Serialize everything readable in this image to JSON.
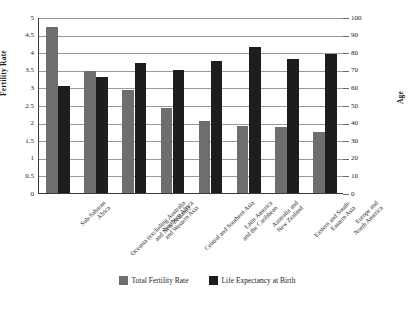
{
  "chart_data": {
    "type": "bar",
    "title": "",
    "xlabel": "",
    "ylabel": "Fertility Rate",
    "y2label": "Age",
    "ylim": [
      0,
      5
    ],
    "y2lim": [
      0,
      100
    ],
    "yticks": [
      "0",
      "0.5",
      "1",
      "1.5",
      "2",
      "2.5",
      "3",
      "3.5",
      "4",
      "4.5",
      "5"
    ],
    "y2ticks": [
      "0",
      "10",
      "20",
      "30",
      "40",
      "50",
      "60",
      "70",
      "80",
      "90",
      "100"
    ],
    "grid": true,
    "legend_position": "bottom",
    "categories": [
      "Sub-Saharan\nAfrica",
      "Oceania (excluding Australia\nand New Zealand)",
      "Northern Africa\nand Western Asia",
      "Central and Southern Asia",
      "Latin America\nand the Caribbean",
      "Australia and\nNew Zealand",
      "Eastern and South-\nEastern Asia",
      "Europe and\nNorth America"
    ],
    "series": [
      {
        "name": "Total Fertility Rate",
        "color": "#6e6e6e",
        "axis": "left",
        "values": [
          4.72,
          3.47,
          2.93,
          2.42,
          2.06,
          1.89,
          1.87,
          1.73
        ]
      },
      {
        "name": "Life Expectancy at Birth",
        "color": "#1d1d1d",
        "axis": "right",
        "values": [
          60.6,
          66.2,
          73.6,
          70.0,
          75.2,
          82.7,
          76.4,
          78.9
        ]
      }
    ]
  }
}
